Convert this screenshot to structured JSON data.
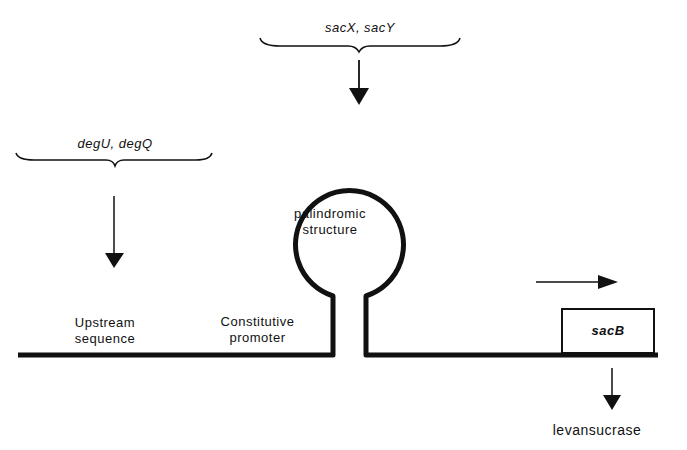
{
  "diagram": {
    "regulators_top": {
      "label": "sacX, sacY"
    },
    "regulators_left": {
      "label": "degU, degQ"
    },
    "loop": {
      "label_line1": "palindromic",
      "label_line2": "structure"
    },
    "upstream": {
      "label_line1": "Upstream",
      "label_line2": "sequence"
    },
    "promoter": {
      "label_line1": "Constitutive",
      "label_line2": "promoter"
    },
    "gene": {
      "label": "sacB"
    },
    "product": {
      "label": "levansucrase"
    },
    "colors": {
      "ink": "#111111",
      "background": "#ffffff"
    }
  }
}
